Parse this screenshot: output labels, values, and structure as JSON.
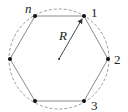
{
  "diagram": {
    "type": "regular-polygon-inscribed-in-circle",
    "colors": {
      "polygon": "#8a8a8a",
      "circle": "#9a9a9a",
      "vertex": "#111111",
      "arrow": "#333333"
    },
    "center": {
      "x": 59,
      "y": 59
    },
    "circle_radius": 50,
    "vertices": [
      {
        "x": 84,
        "y": 16,
        "label": "1"
      },
      {
        "x": 108,
        "y": 59,
        "label": "2"
      },
      {
        "x": 84,
        "y": 101,
        "label": "3"
      },
      {
        "x": 35,
        "y": 101,
        "label": ""
      },
      {
        "x": 10,
        "y": 59,
        "label": ""
      },
      {
        "x": 35,
        "y": 16,
        "label": "n"
      }
    ],
    "labels": {
      "v1": "1",
      "v2": "2",
      "v3": "3",
      "vn": "n",
      "radius": "R"
    }
  }
}
